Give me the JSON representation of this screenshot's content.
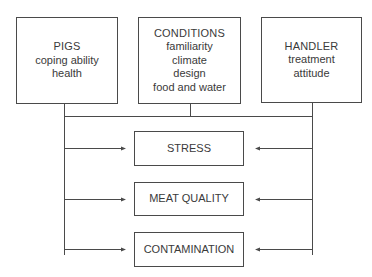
{
  "diagram": {
    "inputs": [
      {
        "title": "PIGS",
        "items": [
          "coping ability",
          "health"
        ]
      },
      {
        "title": "CONDITIONS",
        "items": [
          "familiarity",
          "climate",
          "design",
          "food and water"
        ]
      },
      {
        "title": "HANDLER",
        "items": [
          "treatment",
          "attitude"
        ]
      }
    ],
    "outputs": [
      {
        "label": "STRESS"
      },
      {
        "label": "MEAT QUALITY"
      },
      {
        "label": "CONTAMINATION"
      }
    ],
    "colors": {
      "line": "#4a4a4a",
      "text": "#3a3a3a",
      "background": "#ffffff"
    }
  }
}
